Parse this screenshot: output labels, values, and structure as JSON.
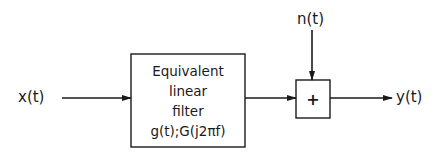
{
  "diagram": {
    "type": "block-diagram",
    "input": {
      "label": "x(t)"
    },
    "filter": {
      "lines": [
        "Equivalent",
        "linear",
        "filter",
        "g(t);G(j2πf)"
      ]
    },
    "noise": {
      "label": "n(t)"
    },
    "summer": {
      "symbol": "+"
    },
    "output": {
      "label": "y(t)"
    },
    "colors": {
      "stroke": "#1a1a1a",
      "background": "#ffffff"
    }
  }
}
